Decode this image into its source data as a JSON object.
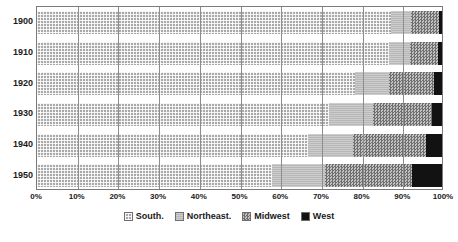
{
  "chart_data": {
    "type": "bar",
    "orientation": "horizontal",
    "stacked": true,
    "stack_mode": "percent",
    "title": "",
    "xlabel": "",
    "ylabel": "",
    "xlim": [
      0,
      100
    ],
    "xtick_labels": [
      "0%",
      "10%",
      "20%",
      "30%",
      "40%",
      "50%",
      "60%",
      "70%",
      "80%",
      "90%",
      "100%"
    ],
    "xticks": [
      0,
      10,
      20,
      30,
      40,
      50,
      60,
      70,
      80,
      90,
      100
    ],
    "grid": true,
    "legend_position": "bottom",
    "categories": [
      "1900",
      "1910",
      "1920",
      "1930",
      "1940",
      "1950"
    ],
    "series": [
      {
        "name": "South.",
        "color": "#a9a9a9",
        "pattern": "crosshatch-grid",
        "values": [
          87.5,
          87.0,
          78.5,
          72.0,
          67.0,
          58.0
        ]
      },
      {
        "name": "Northeast.",
        "color": "#b7b7b7",
        "pattern": "solid-light",
        "values": [
          4.9,
          5.0,
          8.5,
          11.0,
          11.0,
          13.0
        ]
      },
      {
        "name": "Midwest",
        "color": "#9a9a9a",
        "pattern": "checker-dither",
        "values": [
          6.9,
          7.0,
          11.0,
          14.5,
          18.0,
          21.5
        ]
      },
      {
        "name": "West",
        "color": "#121212",
        "pattern": "solid-black",
        "values": [
          0.7,
          1.0,
          2.0,
          2.5,
          4.0,
          7.5
        ]
      }
    ]
  },
  "legend": {
    "items": [
      {
        "label": "South."
      },
      {
        "label": "Northeast."
      },
      {
        "label": "Midwest"
      },
      {
        "label": "West"
      }
    ]
  }
}
